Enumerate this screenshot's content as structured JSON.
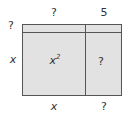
{
  "top_labels": {
    "left": "?",
    "right": "5"
  },
  "side_labels": {
    "top": "?",
    "bottom": "x"
  },
  "cells": {
    "main": "x",
    "main_exp": "2",
    "right": "?"
  },
  "bottom_labels": {
    "left": "x",
    "right": "?"
  },
  "colors": {
    "fill": "#e2e2e2",
    "line": "#555555"
  }
}
